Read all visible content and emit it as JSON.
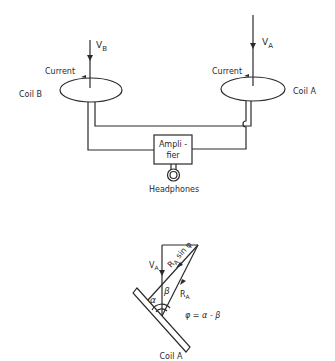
{
  "top_diagram": {
    "coil_b": {
      "label": "Coil B",
      "current_label": "Current",
      "velocity_label": "V",
      "velocity_sub": "B"
    },
    "coil_a": {
      "label": "Coil A",
      "current_label": "Current",
      "velocity_label": "V",
      "velocity_sub": "A"
    },
    "amplifier": {
      "line1": "Ampli -",
      "line2": "fier"
    },
    "headphones": {
      "label": "Headphones"
    }
  },
  "bottom_diagram": {
    "va_label": "V",
    "va_sub": "A",
    "ra_sin_label": "R",
    "ra_sin_sub": "A",
    "ra_sin_suffix": " sin φ",
    "ra_label": "R",
    "ra_sub": "A",
    "alpha": "α",
    "beta": "β",
    "equation": "φ = α - β",
    "coil_label": "Coil A"
  },
  "colors": {
    "ink": "#2a2a2a",
    "background": "#ffffff"
  }
}
